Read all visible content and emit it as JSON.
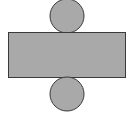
{
  "diagram": {
    "colors": {
      "fill": "#a9a9a9",
      "stroke": "#3a3a3a",
      "background": "#ffffff"
    },
    "shapes": {
      "top_circle": {
        "cx": 67,
        "cy": 16,
        "r": 17
      },
      "rectangle": {
        "x": 8,
        "y": 32,
        "width": 117,
        "height": 45
      },
      "bottom_circle": {
        "cx": 67,
        "cy": 94,
        "r": 17
      }
    }
  }
}
